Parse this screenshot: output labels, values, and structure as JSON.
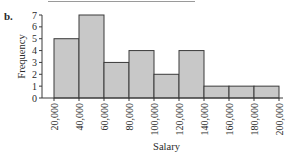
{
  "figure": {
    "part_label": "b."
  },
  "chart_data": {
    "type": "bar",
    "subtype": "histogram",
    "title": "",
    "xlabel": "Salary",
    "ylabel": "Frequency",
    "bin_edges": [
      20000,
      40000,
      60000,
      80000,
      100000,
      120000,
      140000,
      160000,
      180000,
      200000
    ],
    "x_tick_labels": [
      "20,000",
      "40,000",
      "60,000",
      "80,000",
      "100,000",
      "120,000",
      "140,000",
      "160,000",
      "180,000",
      "200,000"
    ],
    "categories": [
      "20,000–40,000",
      "40,000–60,000",
      "60,000–80,000",
      "80,000–100,000",
      "100,000–120,000",
      "120,000–140,000",
      "140,000–160,000",
      "160,000–180,000",
      "180,000–200,000"
    ],
    "values": [
      5,
      7,
      3,
      4,
      2,
      4,
      1,
      1,
      1
    ],
    "y_ticks": [
      0,
      1,
      2,
      3,
      4,
      5,
      6,
      7
    ],
    "ylim": [
      0,
      7
    ],
    "grid": false,
    "legend": null,
    "colors": {
      "bar_fill": "#c8c8c8",
      "bar_stroke": "#3a3a3a",
      "axis": "#3a3a3a"
    }
  }
}
